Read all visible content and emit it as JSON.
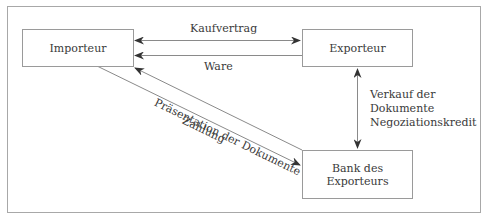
{
  "diagram": {
    "nodes": {
      "importer": {
        "label": "Importeur"
      },
      "exporter": {
        "label": "Exporteur"
      },
      "bank": {
        "label_line1": "Bank des",
        "label_line2": "Exporteurs"
      }
    },
    "edges": {
      "purchase_contract": {
        "label": "Kaufvertrag",
        "from": "Importeur",
        "to": "Exporteur",
        "direction": "both"
      },
      "goods": {
        "label": "Ware",
        "from": "Exporteur",
        "to": "Importeur",
        "direction": "forward"
      },
      "document_presentation": {
        "label": "Präsentation der Dokumente",
        "from": "Bank des Exporteurs",
        "to": "Importeur",
        "direction": "forward"
      },
      "payment": {
        "label": "Zahlung",
        "from": "Importeur",
        "to": "Bank des Exporteurs",
        "direction": "forward"
      },
      "negotiation": {
        "label_line1": "Verkauf der",
        "label_line2": "Dokumente",
        "label_line3": "Negoziationskredit",
        "from": "Exporteur",
        "to": "Bank des Exporteurs",
        "direction": "both"
      }
    },
    "colors": {
      "line": "#8a8a8a",
      "arrowhead": "#333333",
      "text": "#3a3a3a",
      "border": "#9a9a9a"
    }
  }
}
